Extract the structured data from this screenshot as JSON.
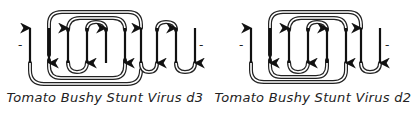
{
  "colors": {
    "strand": "#111111",
    "loop_outer": "#222222",
    "loop_inner": "#ffffff",
    "text": "#222222"
  },
  "diagrams": [
    {
      "caption": "Tomato Bushy  Stunt Virus  d3",
      "n_terminus": "-",
      "c_terminus": "-",
      "strands_x": [
        30,
        49,
        68,
        87,
        106,
        125,
        141,
        157,
        176,
        195
      ],
      "strand_directions": [
        "up",
        "down",
        "up",
        "down",
        "up",
        "down",
        "up",
        "down",
        "up",
        "down"
      ]
    },
    {
      "caption": "Tomato Bushy  Stunt Virus  d2",
      "n_terminus": "-",
      "c_terminus": "-",
      "strands_x": [
        251,
        270,
        289,
        308,
        327,
        346,
        361,
        380
      ],
      "strand_directions": [
        "up",
        "down",
        "up",
        "down",
        "up",
        "down",
        "up",
        "down"
      ]
    }
  ]
}
